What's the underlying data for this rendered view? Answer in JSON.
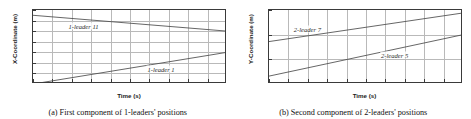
{
  "figure": {
    "panels": [
      {
        "id": "panel-a",
        "caption": "(a) First component of 1-leaders' positions",
        "chart_data": {
          "type": "line",
          "title": "",
          "xlabel": "Time (s)",
          "ylabel": "X-Coordinate (m)",
          "xlim": [
            0,
            20
          ],
          "ylim": [
            -8,
            6
          ],
          "xticks": [
            0,
            2,
            4,
            6,
            8,
            10,
            12,
            14,
            16,
            18,
            20
          ],
          "xtick_labels": [
            "0",
            "2",
            "4",
            "6",
            "8",
            "10",
            "12",
            "14",
            "16",
            "18",
            "20"
          ],
          "yticks": [
            6,
            4,
            2,
            0,
            -2,
            -4,
            -6,
            -8
          ],
          "ytick_labels": [
            "6",
            "4",
            "2",
            "0",
            "-2",
            "-4",
            "-6",
            "-8"
          ],
          "grid": true,
          "legend_position": "inline-annotations",
          "series": [
            {
              "name": "1-leader 11",
              "color": "#4a4a4a",
              "x": [
                0,
                20
              ],
              "values": [
                5.0,
                2.0
              ],
              "label_x": 5.2,
              "label_y": 3.0
            },
            {
              "name": "1-leader 1",
              "color": "#4a4a4a",
              "x": [
                0,
                20
              ],
              "values": [
                -8.0,
                -2.0
              ],
              "label_x": 13.2,
              "label_y": -5.2
            }
          ]
        }
      },
      {
        "id": "panel-b",
        "caption": "(b) Second component of 2-leaders' positions",
        "chart_data": {
          "type": "line",
          "title": "",
          "xlabel": "Time (s)",
          "ylabel": "Y-Coordinate (m)",
          "xlim": [
            0,
            20
          ],
          "ylim": [
            -10,
            5
          ],
          "xticks": [
            0,
            2,
            4,
            6,
            8,
            10,
            12,
            14,
            16,
            18,
            20
          ],
          "xtick_labels": [
            "0",
            "2",
            "4",
            "6",
            "8",
            "10",
            "12",
            "14",
            "16",
            "18",
            "20"
          ],
          "yticks": [
            5,
            0,
            -5,
            -10
          ],
          "ytick_labels": [
            "5",
            "0",
            "-5",
            "-10"
          ],
          "grid": true,
          "legend_position": "inline-annotations",
          "series": [
            {
              "name": "2-leader 7",
              "color": "#4a4a4a",
              "x": [
                0,
                20
              ],
              "values": [
                -1.4,
                4.4
              ],
              "label_x": 4.0,
              "label_y": 1.2
            },
            {
              "name": "2-leader 5",
              "color": "#4a4a4a",
              "x": [
                0,
                20
              ],
              "values": [
                -8.4,
                0.0
              ],
              "label_x": 13.0,
              "label_y": -4.2
            }
          ]
        }
      }
    ]
  }
}
